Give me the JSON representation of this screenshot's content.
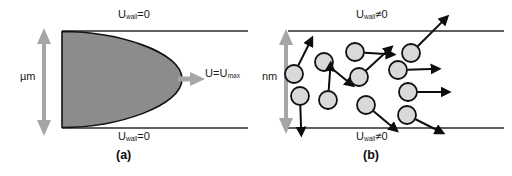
{
  "figure": {
    "panels": [
      {
        "id": "a",
        "caption": "(a)",
        "scale_label": "µm",
        "wall_top_label_main": "U",
        "wall_top_label_sub": "wall",
        "wall_top_label_rel": "=0",
        "wall_bottom_label_main": "U",
        "wall_bottom_label_sub": "wall",
        "wall_bottom_label_rel": "=0",
        "velocity_label_main": "U=U",
        "velocity_label_sub": "max",
        "description": "continuum parabolic velocity profile with no-slip wall condition"
      },
      {
        "id": "b",
        "caption": "(b)",
        "scale_label": "nm",
        "wall_top_label_main": "U",
        "wall_top_label_sub": "wall",
        "wall_top_label_rel": "≠0",
        "wall_bottom_label_main": "U",
        "wall_bottom_label_sub": "wall",
        "wall_bottom_label_rel": "≠0",
        "description": "molecular scale flow with discrete particles and wall slip"
      }
    ]
  },
  "colors": {
    "wall_line": "#2b2b2b",
    "profile_fill": "#8c8c8c",
    "profile_stroke": "#121212",
    "arrow_gray": "#a6a6a6",
    "particle_fill": "#d9d9d9",
    "particle_stroke": "#111111",
    "vector_arrow": "#0d0d0d",
    "text": "#1a1a1a",
    "background": "#ffffff"
  },
  "chart_data": {
    "type": "diagram",
    "panel_a": {
      "channel_top_y": 31,
      "channel_bottom_y": 128,
      "profile_type": "parabolic",
      "profile_x_start": 62,
      "profile_max_x": 182,
      "centerline_y": 79,
      "wall_velocity": 0,
      "centerline_velocity": "U_max"
    },
    "panel_b": {
      "channel_top_y": 31,
      "channel_bottom_y": 128,
      "wall_velocity": "nonzero",
      "particle_radius": 9,
      "particles": [
        {
          "cx": 38,
          "cy": 74,
          "vx": 14,
          "vy": -28
        },
        {
          "cx": 68,
          "cy": 62,
          "vx": 22,
          "vy": 18
        },
        {
          "cx": 99,
          "cy": 52,
          "vx": 30,
          "vy": 2
        },
        {
          "cx": 72,
          "cy": 100,
          "vx": 2,
          "vy": -28
        },
        {
          "cx": 44,
          "cy": 96,
          "vx": 1,
          "vy": 30
        },
        {
          "cx": 103,
          "cy": 77,
          "vx": 26,
          "vy": -24
        },
        {
          "cx": 110,
          "cy": 105,
          "vx": 24,
          "vy": 20
        },
        {
          "cx": 142,
          "cy": 70,
          "vx": 32,
          "vy": -1
        },
        {
          "cx": 155,
          "cy": 53,
          "vx": 30,
          "vy": -30
        },
        {
          "cx": 152,
          "cy": 92,
          "vx": 32,
          "vy": 0
        },
        {
          "cx": 151,
          "cy": 115,
          "vx": 28,
          "vy": 14
        }
      ]
    }
  }
}
